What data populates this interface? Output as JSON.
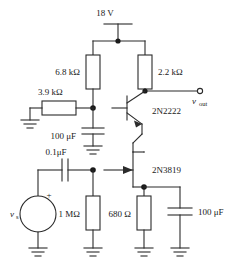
{
  "diagram": {
    "supply": {
      "label": "18 V"
    },
    "components": {
      "r_collector_left": "6.8 kΩ",
      "r_collector_right": "2.2 kΩ",
      "r_base": "3.9 kΩ",
      "c_base_bypass": "100 μF",
      "c_coupling": "0.1μF",
      "r_gate": "1 MΩ",
      "r_source": "680 Ω",
      "c_source_bypass": "100 μF",
      "q_bjt": "2N2222",
      "q_jfet": "2N3819"
    },
    "terminals": {
      "v_out_main": "v",
      "v_out_sub": "out",
      "v_source_main": "v",
      "v_source_sub": "s",
      "source_polarity": "+"
    },
    "colors": {
      "wire": "#2b2b2b",
      "background": "#ffffff",
      "text": "#1a1a1a"
    }
  }
}
